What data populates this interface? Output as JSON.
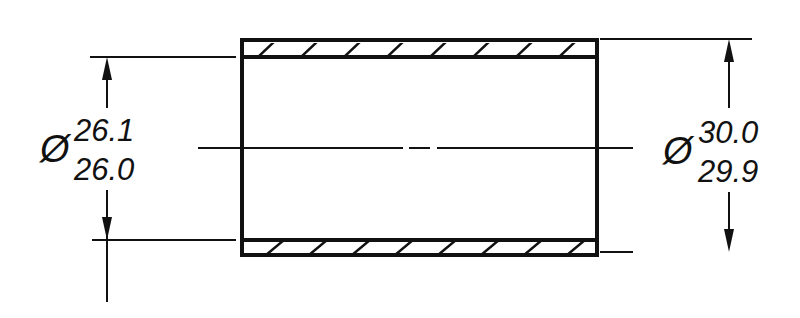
{
  "drawing": {
    "title": "Bushing cross-section",
    "inner_diameter": {
      "symbol": "Ø",
      "upper": "26.1",
      "lower": "26.0"
    },
    "outer_diameter": {
      "symbol": "Ø",
      "upper": "30.0",
      "lower": "29.9"
    },
    "colors": {
      "line": "#111111",
      "background": "#ffffff"
    }
  }
}
